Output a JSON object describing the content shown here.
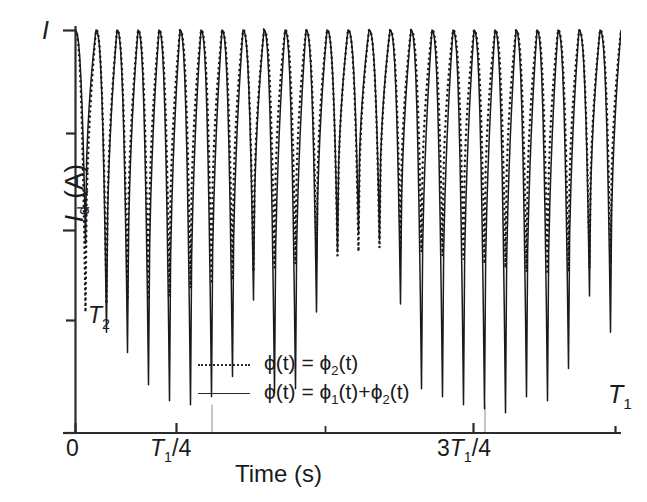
{
  "figure": {
    "peak_marker_label": "I",
    "y_axis_title": "I",
    "y_axis_title_sub": "d",
    "y_axis_title_unit": "(A)",
    "y_tick_label": "T",
    "y_tick_label_sub": "2",
    "x_axis_title": "Time (s)",
    "x_tick_0": "0",
    "x_tick_quarter_base": "T",
    "x_tick_quarter_sub": "1",
    "x_tick_quarter_suffix": "/4",
    "x_tick_threequarter_prefix": "3",
    "x_tick_threequarter_base": "T",
    "x_tick_threequarter_sub": "1",
    "x_tick_threequarter_suffix": "/4",
    "x_end_label_base": "T",
    "x_end_label_sub": "1"
  },
  "legend": {
    "position": "inside-lower-center",
    "entries": [
      {
        "style": "dotted",
        "lhs": "ϕ(t) = ",
        "rhs_base": "ϕ",
        "rhs_sub": "2",
        "rhs_tail": "(t)"
      },
      {
        "style": "solid",
        "lhs": "ϕ(t) = ",
        "rhs_base": "ϕ",
        "rhs_sub": "1",
        "rhs_tail": "(t)+",
        "rhs_base2": "ϕ",
        "rhs_sub2": "2",
        "rhs_tail2": "(t)"
      }
    ]
  },
  "style": {
    "line_color": "#1a1a1a",
    "axis_color": "#2b2b2b",
    "guide_color": "#8d8d8d",
    "background": "#ffffff"
  },
  "chart_data": {
    "type": "line",
    "title": "",
    "xlabel": "Time (s)",
    "ylabel": "I_d (A)",
    "grid": false,
    "legend_position": "inside lower center",
    "xlim": [
      0,
      1
    ],
    "ylim": [
      0,
      1
    ],
    "x_tick_values": [
      0,
      0.25,
      0.5,
      0.75,
      1.0
    ],
    "x_tick_labels": [
      "0",
      "T_1/4",
      "",
      "3T_1/4",
      "T_1"
    ],
    "y_tick_values": [
      0.105,
      0.275,
      0.5,
      0.7,
      1.0
    ],
    "y_tick_labels": [
      "",
      "T_2",
      "",
      "",
      "I"
    ],
    "annotations": [
      {
        "text": "I",
        "x": 0.0,
        "y": 1.04,
        "note": "peak current marker at top of y axis"
      },
      {
        "text": "T_2",
        "x": 0.03,
        "y": 0.275,
        "note": "fast-oscillation period marker on y axis"
      },
      {
        "text": "T_1",
        "x": 1.0,
        "y": 0.13,
        "note": "slow-modulation period marker at axis end"
      }
    ],
    "guide_lines": [
      {
        "orientation": "vertical",
        "x": 0.25,
        "style": "thin-solid",
        "note": "marks T_1/4"
      },
      {
        "orientation": "vertical",
        "x": 0.75,
        "style": "thin-solid",
        "note": "marks 3T_1/4"
      }
    ],
    "series": [
      {
        "name": "ϕ(t) = ϕ₂(t)",
        "style": "dotted",
        "n_spikes": 26,
        "baseline": 1.0,
        "spike_depth_values": [
          0.3,
          0.32,
          0.33,
          0.33,
          0.34,
          0.36,
          0.37,
          0.38,
          0.4,
          0.41,
          0.42,
          0.43,
          0.44,
          0.45,
          0.46,
          0.46,
          0.45,
          0.44,
          0.43,
          0.42,
          0.41,
          0.4,
          0.4,
          0.4,
          0.41,
          0.42
        ],
        "note": "trough y-values of each fast dip (axis-fraction, 1 = top)"
      },
      {
        "name": "ϕ(t) = ϕ₁(t)+ϕ₂(t)",
        "style": "solid",
        "n_spikes": 26,
        "baseline": 1.0,
        "spike_depth_values": [
          0.47,
          0.25,
          0.2,
          0.12,
          0.08,
          0.07,
          0.09,
          0.14,
          0.33,
          0.1,
          0.11,
          0.3,
          0.45,
          0.5,
          0.48,
          0.32,
          0.11,
          0.09,
          0.07,
          0.06,
          0.05,
          0.09,
          0.08,
          0.16,
          0.34,
          0.25
        ],
        "note": "trough y-values of each fast dip (axis-fraction, 1 = top); depth modulated at slow period T_1"
      }
    ]
  }
}
